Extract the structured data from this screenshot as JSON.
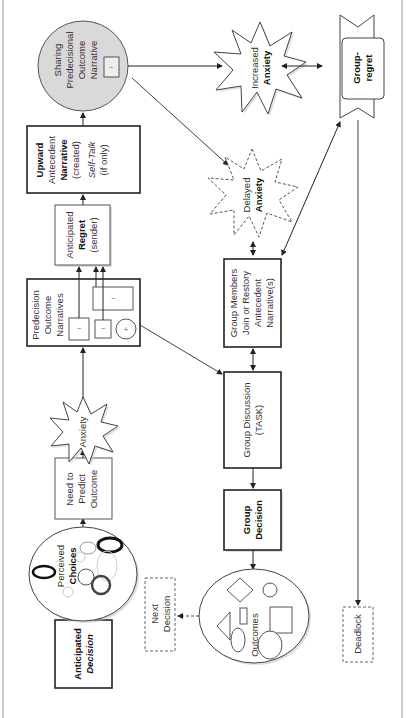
{
  "diagram": {
    "orientation": "rotated-90-ccw",
    "nodes": {
      "anticipated_decision": {
        "line1": "Anticipated",
        "line2": "Decision"
      },
      "perceived_choices": {
        "line1": "Perceived",
        "line2": "Choices"
      },
      "need_to_predict": {
        "line1": "Need to",
        "line2": "Predict",
        "line3": "Outcome"
      },
      "anxiety": {
        "label": "Anxiety"
      },
      "predecision": {
        "line1": "Predecision",
        "line2": "Outcome",
        "line3": "Narratives",
        "minus": "−",
        "plus": "+"
      },
      "anticipated_regret": {
        "line1": "Anticipated",
        "line2": "Regret",
        "line3": "(sender)"
      },
      "upward": {
        "line1": "Upward",
        "line2": "Antecedent",
        "line3": "Narrative",
        "line4": "(created)",
        "line5": "Self-Talk",
        "line6": "(if only)"
      },
      "sharing": {
        "line1": "Sharing",
        "line2": "Predecisional",
        "line3": "Outcome",
        "line4": "Narrative",
        "minus": "−"
      },
      "increased_anxiety": {
        "line1": "Increased",
        "line2": "Anxiety"
      },
      "delayed_anxiety": {
        "line1": "Delayed",
        "line2": "Anxiety"
      },
      "group_regret": {
        "line1": "Group-",
        "line2": "regret"
      },
      "group_members": {
        "line1": "Group Members",
        "line2": "Join or Restory",
        "line3": "Antecedent",
        "line4": "Narrative(s)"
      },
      "group_discussion": {
        "line1": "Group Discussion",
        "line2": "(TASK)"
      },
      "group_decision": {
        "line1": "Group",
        "line2": "Decision"
      },
      "outcomes": {
        "label": "Outcomes"
      },
      "next_decision": {
        "line1": "Next",
        "line2": "Decision"
      },
      "deadlock": {
        "label": "Deadlock"
      }
    },
    "colors": {
      "stroke": "#222222",
      "sharing_fill": "#d9d9d9",
      "shadow": "#bbbbbb"
    }
  }
}
